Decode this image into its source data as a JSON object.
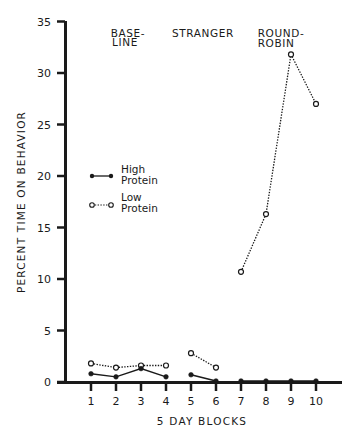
{
  "chart_data": {
    "type": "line",
    "title": "",
    "xlabel": "5 DAY BLOCKS",
    "ylabel": "PERCENT TIME ON BEHAVIOR",
    "x": [
      1,
      2,
      3,
      4,
      5,
      6,
      7,
      8,
      9,
      10
    ],
    "x_tick_labels": [
      "1",
      "2",
      "3",
      "4",
      "5",
      "6",
      "7",
      "8",
      "9",
      "10"
    ],
    "ylim": [
      0,
      35
    ],
    "y_ticks": [
      0,
      5,
      10,
      15,
      20,
      25,
      30,
      35
    ],
    "y_tick_labels": [
      "0",
      "5",
      "10",
      "15",
      "20",
      "25",
      "30",
      "35"
    ],
    "grid": false,
    "legend_position": "upper-left inside plot",
    "phases": [
      {
        "label_line1": "BASE-",
        "label_line2": "LINE",
        "blocks": [
          1,
          2,
          3,
          4
        ]
      },
      {
        "label_line1": "STRANGER",
        "label_line2": "",
        "blocks": [
          5,
          6
        ]
      },
      {
        "label_line1": "ROUND-",
        "label_line2": "ROBIN",
        "blocks": [
          7,
          8,
          9,
          10
        ]
      }
    ],
    "series": [
      {
        "name": "High Protein",
        "legend_line1": "High",
        "legend_line2": "Protein",
        "marker": "filled-circle",
        "line_style": "solid",
        "segments": [
          [
            1,
            2,
            3,
            4
          ],
          [
            5,
            6
          ],
          [
            7,
            8,
            9,
            10
          ]
        ],
        "values": [
          0.8,
          0.5,
          1.3,
          0.5,
          0.7,
          0.1,
          0.1,
          0.1,
          0.1,
          0.1
        ]
      },
      {
        "name": "Low Protein",
        "legend_line1": "Low",
        "legend_line2": "Protein",
        "marker": "open-circle",
        "line_style": "dotted",
        "segments": [
          [
            1,
            2,
            3,
            4
          ],
          [
            5,
            6
          ],
          [
            7,
            8,
            9,
            10
          ]
        ],
        "values": [
          1.8,
          1.4,
          1.6,
          1.6,
          2.8,
          1.4,
          10.7,
          16.3,
          31.8,
          27.0
        ]
      }
    ]
  },
  "colors": {
    "ink": "#1a1a1a",
    "background": "#ffffff"
  }
}
